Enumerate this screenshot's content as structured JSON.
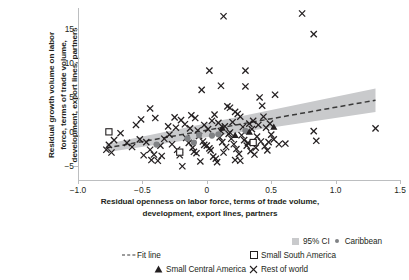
{
  "chart_data": {
    "type": "scatter",
    "title": "",
    "xlabel": "Residual openness on labor force, terms of trade volume, development, export lines, partners",
    "xlabel_line1": "Residual openness on labor force, terms of trade volume,",
    "xlabel_line2": "development, export lines, partners",
    "ylabel": "Residual growth volume on labor force, terms of trade volume, development, export lines, partners",
    "ylabel_line1": "Residual growth volume on labor",
    "ylabel_line2": "force, terms of trade volume,",
    "ylabel_line3": "development, export lines, partners",
    "xlim": [
      -1.0,
      1.5
    ],
    "ylim": [
      -7.0,
      18.0
    ],
    "xticks": [
      -1.0,
      -0.5,
      0,
      0.5,
      1.0,
      1.5
    ],
    "xticklabels": [
      "−1.0",
      "−0.5",
      "0",
      "0.5",
      "1.0",
      "1.5"
    ],
    "yticks": [
      -5,
      0,
      5,
      10,
      15
    ],
    "yticklabels": [
      "−5",
      "0",
      "5",
      "10",
      "15"
    ],
    "grid": false,
    "legend_position": "below-plot",
    "fit_line": {
      "style": "dashed",
      "color": "#3a3a3a",
      "x_start": -0.78,
      "y_start": -2.35,
      "x_end": 1.31,
      "y_end": 4.6
    },
    "confidence_band": {
      "label": "95% CI",
      "level": 95,
      "color": "#c9cacc",
      "x_start": -0.78,
      "x_end": 1.31,
      "lower_start": -2.95,
      "upper_start": -1.75,
      "lower_end": 2.9,
      "upper_end": 6.3
    },
    "series": [
      {
        "name": "Rest of world",
        "marker": "x",
        "color": "#231f20",
        "points": [
          [
            0.13,
            16.8
          ],
          [
            0.74,
            17.2
          ],
          [
            0.83,
            14.2
          ],
          [
            0.02,
            8.9
          ],
          [
            0.3,
            8.9
          ],
          [
            0.11,
            6.7
          ],
          [
            0.3,
            6.6
          ],
          [
            -0.04,
            6.1
          ],
          [
            0.53,
            5.4
          ],
          [
            0.41,
            5.0
          ],
          [
            0.43,
            3.8
          ],
          [
            -0.44,
            3.4
          ],
          [
            0.16,
            3.7
          ],
          [
            0.18,
            3.5
          ],
          [
            0.22,
            2.9
          ],
          [
            -0.4,
            2.0
          ],
          [
            -0.51,
            1.8
          ],
          [
            -0.55,
            1.0
          ],
          [
            -0.25,
            2.1
          ],
          [
            -0.2,
            1.7
          ],
          [
            -0.12,
            2.4
          ],
          [
            -0.09,
            2.0
          ],
          [
            0.06,
            2.5
          ],
          [
            0.24,
            2.6
          ],
          [
            0.26,
            2.2
          ],
          [
            0.44,
            2.2
          ],
          [
            0.36,
            1.6
          ],
          [
            0.33,
            1.2
          ],
          [
            -0.3,
            0.8
          ],
          [
            -0.24,
            0.6
          ],
          [
            -0.17,
            1.1
          ],
          [
            -0.13,
            0.5
          ],
          [
            -0.02,
            1.0
          ],
          [
            0.01,
            0.4
          ],
          [
            0.09,
            1.3
          ],
          [
            0.14,
            0.8
          ],
          [
            0.2,
            1.4
          ],
          [
            0.28,
            0.7
          ],
          [
            0.35,
            0.4
          ],
          [
            0.4,
            1.0
          ],
          [
            0.46,
            0.6
          ],
          [
            0.49,
            1.2
          ],
          [
            0.83,
            0.1
          ],
          [
            1.31,
            0.5
          ],
          [
            -0.67,
            -0.2
          ],
          [
            -0.72,
            -1.2
          ],
          [
            -0.76,
            -1.9
          ],
          [
            -0.78,
            -2.6
          ],
          [
            -0.74,
            -3.0
          ],
          [
            -0.62,
            -1.6
          ],
          [
            -0.58,
            -2.2
          ],
          [
            -0.52,
            -1.1
          ],
          [
            -0.47,
            -1.5
          ],
          [
            -0.44,
            -2.6
          ],
          [
            -0.41,
            -3.3
          ],
          [
            -0.38,
            -4.2
          ],
          [
            -0.43,
            -4.1
          ],
          [
            -0.36,
            -2.0
          ],
          [
            -0.33,
            -1.0
          ],
          [
            -0.29,
            -0.4
          ],
          [
            -0.27,
            -1.8
          ],
          [
            -0.23,
            -2.6
          ],
          [
            -0.21,
            -3.4
          ],
          [
            -0.19,
            -5.0
          ],
          [
            -0.16,
            -0.9
          ],
          [
            -0.14,
            -1.6
          ],
          [
            -0.11,
            -2.3
          ],
          [
            -0.08,
            -3.1
          ],
          [
            -0.06,
            -0.6
          ],
          [
            -0.03,
            -1.4
          ],
          [
            0.0,
            -2.0
          ],
          [
            0.03,
            -2.7
          ],
          [
            0.05,
            -3.6
          ],
          [
            0.08,
            -4.4
          ],
          [
            0.1,
            -0.8
          ],
          [
            0.12,
            -1.5
          ],
          [
            0.15,
            -2.2
          ],
          [
            0.17,
            -0.3
          ],
          [
            0.19,
            -1.0
          ],
          [
            0.21,
            -1.8
          ],
          [
            0.23,
            -2.5
          ],
          [
            0.25,
            -3.2
          ],
          [
            0.27,
            -0.5
          ],
          [
            0.29,
            -1.2
          ],
          [
            0.31,
            -2.0
          ],
          [
            0.34,
            -2.8
          ],
          [
            0.37,
            -3.3
          ],
          [
            0.39,
            -0.7
          ],
          [
            0.42,
            -1.4
          ],
          [
            0.45,
            -2.1
          ],
          [
            0.47,
            -2.7
          ],
          [
            0.5,
            -0.4
          ],
          [
            0.52,
            -1.1
          ],
          [
            0.56,
            -1.8
          ],
          [
            0.61,
            -1.7
          ],
          [
            0.85,
            -1.3
          ],
          [
            -0.05,
            -4.3
          ],
          [
            0.07,
            -3.9
          ],
          [
            0.02,
            -2.4
          ],
          [
            -0.1,
            -2.9
          ],
          [
            0.32,
            -1.6
          ],
          [
            0.38,
            -2.3
          ],
          [
            0.13,
            -3.0
          ],
          [
            -0.02,
            -1.9
          ],
          [
            0.48,
            -1.5
          ],
          [
            0.18,
            -0.1
          ],
          [
            -0.35,
            -3.5
          ],
          [
            -0.49,
            -3.4
          ],
          [
            0.11,
            0.1
          ],
          [
            0.04,
            1.6
          ],
          [
            -0.07,
            0.2
          ],
          [
            0.22,
            -4.1
          ],
          [
            0.26,
            -4.2
          ]
        ]
      },
      {
        "name": "Caribbean",
        "marker": "circle",
        "color": "#808285",
        "points": [
          [
            -0.39,
            -1.85
          ],
          [
            -0.15,
            -0.95
          ],
          [
            -0.1,
            -1.55
          ],
          [
            0.04,
            -0.55
          ],
          [
            0.09,
            -0.35
          ],
          [
            0.3,
            0.15
          ],
          [
            -0.06,
            -0.45
          ]
        ]
      },
      {
        "name": "Small South America",
        "marker": "open-square",
        "color": "#231f20",
        "points": [
          [
            -0.76,
            0.0
          ],
          [
            0.36,
            -1.55
          ],
          [
            -0.21,
            -2.95
          ]
        ]
      },
      {
        "name": "Small Central America",
        "marker": "triangle",
        "color": "#231f20",
        "points": [
          [
            0.22,
            -0.5
          ],
          [
            0.52,
            0.7
          ],
          [
            0.12,
            0.55
          ],
          [
            0.33,
            0.0
          ]
        ]
      }
    ]
  },
  "legend": {
    "items": [
      {
        "label": "95% CI",
        "marker": "ci-swatch"
      },
      {
        "label": "Caribbean",
        "marker": "circle"
      },
      {
        "label": "Fit line",
        "marker": "dashed-line"
      },
      {
        "label": "Small South America",
        "marker": "open-square"
      },
      {
        "label": "Small Central America",
        "marker": "triangle"
      },
      {
        "label": "Rest of world",
        "marker": "x"
      }
    ]
  },
  "colors": {
    "axis": "#bcbec0",
    "text": "#231f20",
    "ci_band": "#c9cacc",
    "fit_line": "#3a3a3a",
    "marker": "#231f20",
    "caribbean": "#808285"
  }
}
